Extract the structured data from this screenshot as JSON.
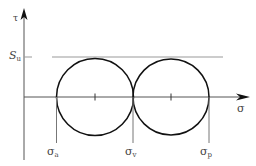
{
  "diagram": {
    "type": "mohr-circle",
    "y_axis_label": "τ",
    "x_axis_label": "σ",
    "horizontal_line_label": {
      "base": "S",
      "sub": "u"
    },
    "point_labels": [
      {
        "base": "σ",
        "sub": "a"
      },
      {
        "base": "σ",
        "sub": "v"
      },
      {
        "base": "σ",
        "sub": "p"
      }
    ],
    "colors": {
      "stroke": "#111111",
      "thin": "#888888",
      "text": "#444444"
    }
  }
}
